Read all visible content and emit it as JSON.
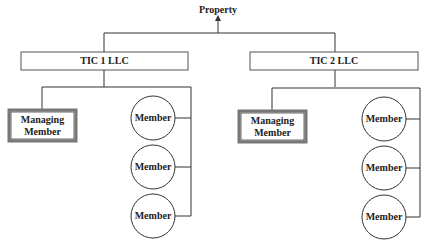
{
  "diagram": {
    "root": {
      "label": "Property"
    },
    "entities": [
      {
        "label": "TIC 1 LLC",
        "managing": "Managing\nMember",
        "managing_lines": [
          "Managing",
          "Member"
        ],
        "members": [
          "Member",
          "Member",
          "Member"
        ]
      },
      {
        "label": "TIC 2 LLC",
        "managing": "Managing\nMember",
        "managing_lines": [
          "Managing",
          "Member"
        ],
        "members": [
          "Member",
          "Member",
          "Member"
        ]
      }
    ],
    "colors": {
      "line": "#333333",
      "box_border": "#555555",
      "background": "#ffffff"
    }
  }
}
